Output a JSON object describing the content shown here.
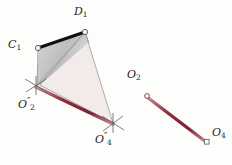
{
  "figure": {
    "background_color": "#fdfdfc",
    "width": 232,
    "height": 165
  },
  "colors": {
    "red_line": "#8d2b39",
    "red_line_light": "#c98f97",
    "thick_black_edge": "#111111",
    "thin_gray_line": "#9a9a9a",
    "gray_fill": "#c9c9c9",
    "pink_fill": "#f1e6e6",
    "marker_stroke": "#5e5e5e",
    "label_color": "#1c1c1c"
  },
  "labels": {
    "d1": {
      "base": "D",
      "sub": "1",
      "prime": ""
    },
    "c1": {
      "base": "C",
      "sub": "1",
      "prime": ""
    },
    "o2pp": {
      "base": "O",
      "sub": "2",
      "prime": "″"
    },
    "o4pp": {
      "base": "O",
      "sub": "4",
      "prime": "″"
    },
    "o2": {
      "base": "O",
      "sub": "2",
      "prime": ""
    },
    "o4": {
      "base": "O",
      "sub": "4",
      "prime": ""
    }
  },
  "points": [
    {
      "name": "D1",
      "x": 85,
      "y": 32,
      "marker": "circle"
    },
    {
      "name": "C1",
      "x": 38,
      "y": 48,
      "marker": "circle"
    },
    {
      "name": "O2pp",
      "x": 36,
      "y": 86,
      "marker": "cross"
    },
    {
      "name": "O4pp",
      "x": 113,
      "y": 123,
      "marker": "cross"
    },
    {
      "name": "O2",
      "x": 147,
      "y": 96,
      "marker": "circle"
    },
    {
      "name": "O4",
      "x": 207,
      "y": 142,
      "marker": "square"
    }
  ],
  "shapes": {
    "gray_quad": "38,48 85,32 90,46 40,84",
    "pink_triangle": "85,32 36,86 113,123",
    "inner_triangle": "85,32 40,84 113,123"
  },
  "segments": [
    {
      "name": "C1-D1",
      "from": "C1",
      "to": "D1",
      "style": "thick-black"
    },
    {
      "name": "C1-O2pp",
      "from": "C1",
      "to": "O2pp",
      "style": "thin-gray"
    },
    {
      "name": "D1-O2pp",
      "from": "D1",
      "to": "O2pp",
      "style": "thin-gray"
    },
    {
      "name": "D1-O4pp",
      "from": "D1",
      "to": "O4pp",
      "style": "thin-gray"
    },
    {
      "name": "O2pp-O4pp",
      "from": "O2pp",
      "to": "O4pp",
      "style": "thick-red"
    },
    {
      "name": "O2-O4",
      "from": "O2",
      "to": "O4",
      "style": "thick-red"
    }
  ]
}
